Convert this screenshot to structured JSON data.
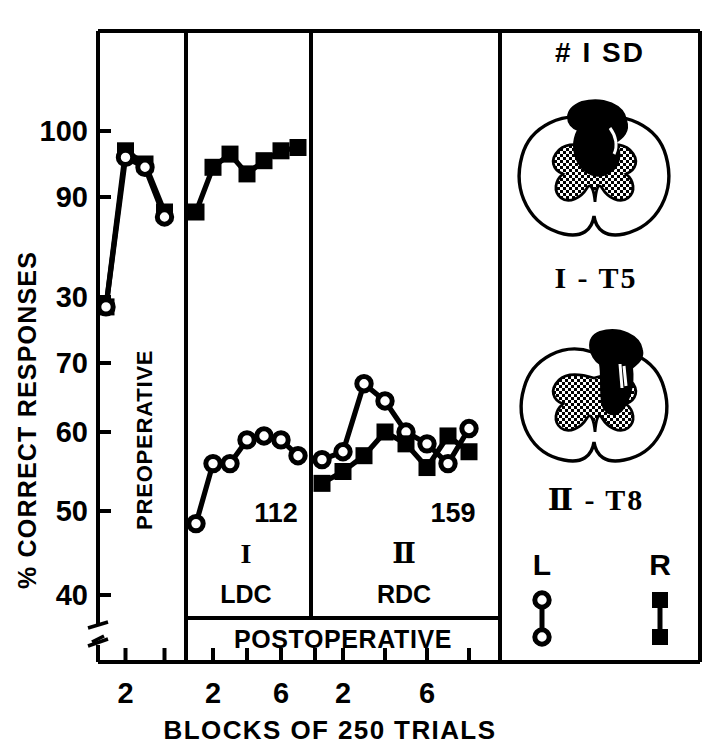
{
  "figure": {
    "ylabel": "% CORRECT RESPONSES",
    "xlabel": "BLOCKS OF 250 TRIALS",
    "ytick_labels": [
      "100",
      "90",
      "30",
      "70",
      "60",
      "50",
      "40"
    ],
    "ytick_values": [
      100,
      90,
      30,
      70,
      60,
      50,
      40
    ],
    "axis_break": true,
    "xaxis_break": true
  },
  "panels": [
    {
      "id": "preoperative",
      "vertical_label": "PREOPERATIVE",
      "roman": "",
      "sublabel": "",
      "annotation": "",
      "xticks": [
        {
          "x": 2,
          "label": "2"
        },
        {
          "x": 4,
          "label": ""
        }
      ]
    },
    {
      "id": "ldc",
      "vertical_label": "",
      "roman": "I",
      "sublabel": "LDC",
      "annotation": "112",
      "xticks": [
        {
          "x": 2,
          "label": "2"
        },
        {
          "x": 4,
          "label": ""
        },
        {
          "x": 6,
          "label": "6"
        },
        {
          "x": 8,
          "label": ""
        }
      ]
    },
    {
      "id": "rdc",
      "vertical_label": "",
      "roman": "Ⅱ",
      "sublabel": "RDC",
      "annotation": "159",
      "xticks": [
        {
          "x": 2,
          "label": "2"
        },
        {
          "x": 4,
          "label": ""
        },
        {
          "x": 6,
          "label": "6"
        },
        {
          "x": 8,
          "label": ""
        }
      ]
    }
  ],
  "bottom_bar": {
    "label": "POSTOPERATIVE"
  },
  "legend": {
    "left_label": "L",
    "left_marker": "open-circle",
    "right_label": "R",
    "right_marker": "filled-square"
  },
  "inset": {
    "title": "# I SD",
    "diagrams": [
      {
        "id": "diagram-1",
        "caption": "I - T5"
      },
      {
        "id": "diagram-2",
        "caption": "Ⅱ - T8"
      }
    ]
  },
  "colors": {
    "ink": "#000000",
    "paper": "#ffffff",
    "stipple": "#000000"
  },
  "chart_data": {
    "type": "line",
    "title": "",
    "xlabel": "BLOCKS OF 250 TRIALS",
    "ylabel": "% CORRECT RESPONSES",
    "ylim": [
      36,
      103
    ],
    "ytick_labels": [
      "100",
      "90",
      "30",
      "70",
      "60",
      "50",
      "40"
    ],
    "yticks": [
      100,
      90,
      80,
      70,
      60,
      50,
      40
    ],
    "grid": false,
    "legend_position": "inset-bottom-right",
    "legend_entries": [
      {
        "name": "L",
        "marker": "open-circle"
      },
      {
        "name": "R",
        "marker": "filled-square"
      }
    ],
    "panels": [
      {
        "name": "PREOPERATIVE",
        "xlim": [
          0.4,
          5.2
        ],
        "series": [
          {
            "name": "R",
            "marker": "filled-square",
            "x": [
              1,
              2,
              3,
              4
            ],
            "values": [
              78.5,
              97,
              95,
              88.5
            ]
          },
          {
            "name": "L",
            "marker": "open-circle",
            "x": [
              1,
              2,
              3,
              4
            ],
            "values": [
              78.5,
              96,
              94.5,
              88
            ]
          }
        ]
      },
      {
        "name": "I  LDC",
        "annotation": "112",
        "xlim": [
          0.4,
          8.0
        ],
        "series": [
          {
            "name": "R",
            "marker": "filled-square",
            "x": [
              1,
              2,
              3,
              4,
              5,
              6,
              7
            ],
            "values": [
              88.5,
              94.5,
              96.5,
              93.5,
              95.5,
              97,
              97.5
            ]
          },
          {
            "name": "L",
            "marker": "open-circle",
            "x": [
              1,
              2,
              3,
              4,
              5,
              6,
              7
            ],
            "values": [
              48.5,
              56,
              56,
              59,
              59.5,
              59,
              57
            ]
          }
        ]
      },
      {
        "name": "Ⅱ  RDC",
        "annotation": "159",
        "xlim": [
          0.4,
          8.4
        ],
        "series": [
          {
            "name": "L",
            "marker": "open-circle",
            "x": [
              1,
              2,
              3,
              4,
              5,
              6,
              7,
              8
            ],
            "values": [
              56.5,
              57.5,
              67,
              64.5,
              60,
              58.5,
              56,
              60.5
            ]
          },
          {
            "name": "R",
            "marker": "filled-square",
            "x": [
              1,
              2,
              3,
              4,
              5,
              6,
              7,
              8
            ],
            "values": [
              53.5,
              55,
              57,
              60,
              58.5,
              55.5,
              59.5,
              57.5
            ]
          }
        ]
      }
    ]
  }
}
